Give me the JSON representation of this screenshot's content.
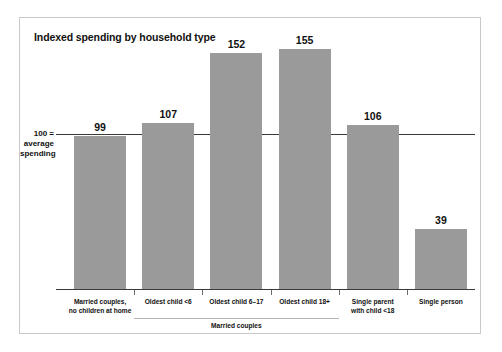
{
  "chart_data": {
    "type": "bar",
    "title": "Indexed spending by household type",
    "categories": [
      "Married couples,\nno children at home",
      "Oldest child <6",
      "Oldest child 6–17",
      "Oldest child 18+",
      "Single parent\nwith child <18",
      "Single person"
    ],
    "values": [
      99,
      107,
      152,
      155,
      106,
      39
    ],
    "xlabel": "",
    "ylabel": "100 = average spending",
    "ylim": [
      0,
      170
    ],
    "grid": false,
    "legend": null,
    "reference_line": {
      "value": 100,
      "label_lines": [
        "100 =",
        "average",
        "spending"
      ]
    },
    "group_brackets": [
      {
        "label": "Married couples",
        "from_category": 1,
        "to_category": 3
      }
    ],
    "colors": {
      "bar": "#9a9a9a",
      "axis": "#3a3a3a",
      "border": "#c9c9c9",
      "text": "#111111",
      "bracket": "#b4b4b4"
    }
  }
}
